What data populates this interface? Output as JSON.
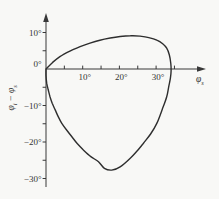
{
  "figure": {
    "background_color": "#f8f8f6",
    "ink_color": "#333333",
    "curve_color": "#2e2e2e"
  },
  "chart_data": {
    "type": "line",
    "title": "",
    "xlabel": "φs",
    "ylabel": "φi − φs",
    "grid": false,
    "legend": "none",
    "x_axis": {
      "label": "φs",
      "label_parts": {
        "sym": "φ",
        "sub": "s"
      },
      "xlim": [
        0,
        38
      ],
      "unit": "degrees",
      "ticks": [
        {
          "value": 10,
          "label": "10°"
        },
        {
          "value": 20,
          "label": "20°"
        },
        {
          "value": 30,
          "label": "30°"
        }
      ],
      "minor_ticks": [
        5,
        10,
        15,
        20,
        25,
        30,
        35
      ]
    },
    "y_axis": {
      "label": "φi − φs",
      "label_parts": {
        "sym1": "φ",
        "sub1": "i",
        "minus": "−",
        "sym2": "φ",
        "sub2": "s"
      },
      "ylim": [
        -32,
        12
      ],
      "unit": "degrees",
      "ticks": [
        {
          "value": 10,
          "label": "10°"
        },
        {
          "value": 0,
          "label": "0°"
        },
        {
          "value": -10,
          "label": "−10°"
        },
        {
          "value": -20,
          "label": "−20°"
        },
        {
          "value": -30,
          "label": "−30°"
        }
      ],
      "minor_ticks": [
        10,
        5,
        -5,
        -10,
        -15,
        -20,
        -25,
        -30
      ]
    },
    "series": [
      {
        "name": "deviation-loop",
        "closed": true,
        "points": [
          [
            0,
            0
          ],
          [
            1.8,
            1.8
          ],
          [
            3.8,
            3.4
          ],
          [
            6.5,
            4.9
          ],
          [
            9.3,
            6.1
          ],
          [
            12,
            7.1
          ],
          [
            14.7,
            7.9
          ],
          [
            17.5,
            8.5
          ],
          [
            20.2,
            8.9
          ],
          [
            23,
            9.1
          ],
          [
            25.6,
            9.0
          ],
          [
            28,
            8.6
          ],
          [
            30.2,
            7.9
          ],
          [
            31.8,
            6.9
          ],
          [
            32.9,
            5.7
          ],
          [
            33.6,
            3.9
          ],
          [
            34.0,
            1.5
          ],
          [
            34.1,
            -0.5
          ],
          [
            33.9,
            -2.5
          ],
          [
            33.4,
            -5
          ],
          [
            32.9,
            -7.6
          ],
          [
            31.7,
            -11
          ],
          [
            30.2,
            -14.9
          ],
          [
            28.5,
            -17.8
          ],
          [
            26.5,
            -20.4
          ],
          [
            24.7,
            -22.6
          ],
          [
            22.9,
            -24.5
          ],
          [
            20.2,
            -26.8
          ],
          [
            17.9,
            -27.7
          ],
          [
            15.9,
            -27.2
          ],
          [
            14.3,
            -25.4
          ],
          [
            12.2,
            -24
          ],
          [
            10.2,
            -22.2
          ],
          [
            8.5,
            -20.4
          ],
          [
            7,
            -18.5
          ],
          [
            5.6,
            -16.7
          ],
          [
            4.3,
            -14.9
          ],
          [
            3.3,
            -13
          ],
          [
            2.5,
            -11.2
          ],
          [
            1.7,
            -9.4
          ],
          [
            1.1,
            -7.6
          ],
          [
            0.6,
            -5.7
          ],
          [
            0.2,
            -3.9
          ],
          [
            0,
            -1.8
          ],
          [
            0,
            0
          ]
        ]
      }
    ]
  }
}
